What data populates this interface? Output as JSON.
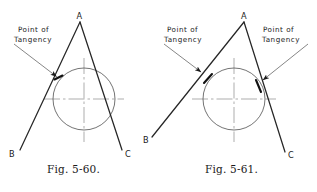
{
  "page": {
    "background": "#ffffff",
    "ink": "#1a1a1a",
    "line_color": "#2b2b2b",
    "thin_color": "#6e6e6e",
    "width": 317,
    "height": 192
  },
  "figures": [
    {
      "id": "fig-5-60",
      "caption": "Fig. 5-60.",
      "vertex_labels": {
        "apex": "A",
        "left": "B",
        "right": "C"
      },
      "annotations": [
        {
          "line1": "Point of",
          "line2": "Tangency"
        }
      ],
      "geometry": {
        "circle": {
          "cx": 84,
          "cy": 99,
          "r": 31
        },
        "apex": {
          "x": 80,
          "y": 22
        },
        "left_end": {
          "x": 20,
          "y": 150
        },
        "right_end": {
          "x": 122,
          "y": 150
        },
        "tangency_points": [
          {
            "x": 58,
            "y": 78
          }
        ]
      }
    },
    {
      "id": "fig-5-61",
      "caption": "Fig. 5-61.",
      "vertex_labels": {
        "apex": "A",
        "left": "B",
        "right": "C"
      },
      "annotations": [
        {
          "line1": "Point of",
          "line2": "Tangency"
        },
        {
          "line1": "Point of",
          "line2": "Tangency"
        }
      ],
      "geometry": {
        "circle": {
          "cx": 234,
          "cy": 99,
          "r": 31
        },
        "apex": {
          "x": 244,
          "y": 22
        },
        "left_end": {
          "x": 152,
          "y": 137
        },
        "right_end": {
          "x": 285,
          "y": 152
        },
        "tangency_points": [
          {
            "x": 208,
            "y": 76
          },
          {
            "x": 259,
            "y": 85
          }
        ]
      }
    }
  ],
  "labels": {
    "point_of": "Point of",
    "tangency": "Tangency",
    "A": "A",
    "B": "B",
    "C": "C"
  }
}
